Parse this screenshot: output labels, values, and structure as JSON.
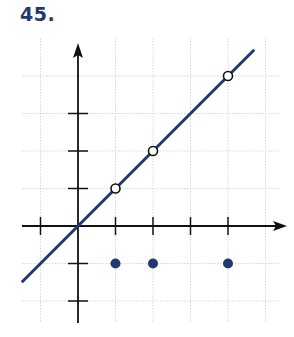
{
  "problem": {
    "number": "45."
  },
  "colors": {
    "line": "#1f3a73",
    "axis": "#111111",
    "grid": "#cccccc",
    "number": "#1f3a73"
  },
  "chart_data": {
    "type": "scatter",
    "title": "45.",
    "xlabel": "",
    "ylabel": "",
    "xlim": [
      -1.5,
      5.3
    ],
    "ylim": [
      -2.5,
      4.8
    ],
    "grid": true,
    "grid_x": [
      -1,
      1,
      2,
      3,
      4,
      5
    ],
    "grid_y": [
      -2,
      -1,
      1,
      2,
      3,
      4
    ],
    "x_ticks": [
      -1,
      1,
      2,
      3,
      4
    ],
    "y_ticks": [
      -2,
      -1,
      1,
      2,
      3
    ],
    "tick_labels_shown": false,
    "series": [
      {
        "name": "line y = x",
        "kind": "line",
        "x": [
          -1.5,
          4.7
        ],
        "y": [
          -1.5,
          4.7
        ],
        "color": "#1f3a73"
      },
      {
        "name": "open points",
        "kind": "open-circle",
        "x": [
          1,
          2,
          4
        ],
        "y": [
          1,
          2,
          4
        ]
      },
      {
        "name": "filled points",
        "kind": "filled-circle",
        "x": [
          1,
          2,
          4
        ],
        "y": [
          -1,
          -1,
          -1
        ],
        "color": "#1f3a73"
      }
    ]
  }
}
